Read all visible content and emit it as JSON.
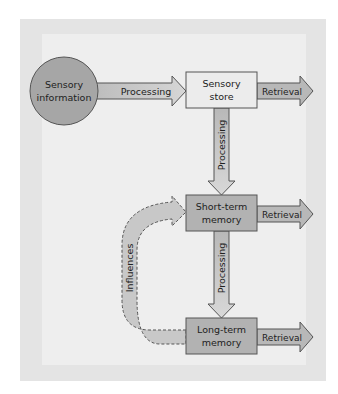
{
  "nodes": {
    "sensory_information": "Sensory information",
    "sensory_information_lines": [
      "Sensory",
      "information"
    ],
    "sensory_store_lines": [
      "Sensory",
      "store"
    ],
    "short_term_lines": [
      "Short-term",
      "memory"
    ],
    "long_term_lines": [
      "Long-term",
      "memory"
    ]
  },
  "arrows": {
    "input_processing": "Processing",
    "sensory_to_short": "Processing",
    "short_to_long": "Processing",
    "retrieval_sensory": "Retrieval",
    "retrieval_short": "Retrieval",
    "retrieval_long": "Retrieval",
    "influences": "Influences"
  },
  "colors": {
    "frame": "#e4e4e4",
    "panel": "#eeeeee",
    "circle": "#a6a6a6",
    "sensory_store": "#ececec",
    "memory_box": "#b2b2b2",
    "arrow_fill": "#c6c6c6",
    "stroke": "#555555"
  }
}
